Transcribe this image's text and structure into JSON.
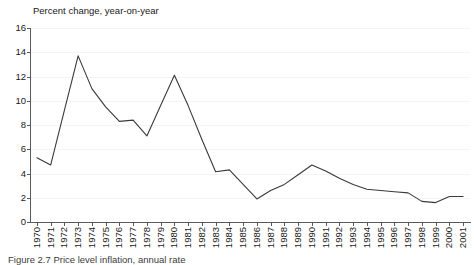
{
  "chart_data": {
    "type": "line",
    "title": "Percent change, year-on-year",
    "xlabel": "",
    "ylabel": "",
    "ylim": [
      0,
      16
    ],
    "yticks": [
      0,
      2,
      4,
      6,
      8,
      10,
      12,
      14,
      16
    ],
    "grid": true,
    "legend": false,
    "line_color": "#3a3a3a",
    "categories": [
      "1970",
      "1971",
      "1972",
      "1973",
      "1974",
      "1975",
      "1976",
      "1977",
      "1978",
      "1979",
      "1980",
      "1981",
      "1982",
      "1983",
      "1984",
      "1985",
      "1986",
      "1987",
      "1988",
      "1989",
      "1990",
      "1991",
      "1992",
      "1993",
      "1994",
      "1995",
      "1996",
      "1997",
      "1998",
      "1999",
      "2000",
      "2001"
    ],
    "values": [
      5.3,
      4.7,
      9.2,
      13.7,
      11.0,
      9.5,
      8.3,
      8.4,
      7.1,
      9.6,
      12.1,
      9.6,
      6.8,
      4.15,
      4.3,
      3.1,
      1.9,
      2.6,
      3.1,
      3.9,
      4.7,
      4.2,
      3.6,
      3.1,
      2.7,
      2.6,
      2.5,
      2.4,
      1.7,
      1.6,
      2.1,
      2.1
    ]
  },
  "caption": {
    "text": "Figure 2.7   Price level inflation, annual rate"
  }
}
